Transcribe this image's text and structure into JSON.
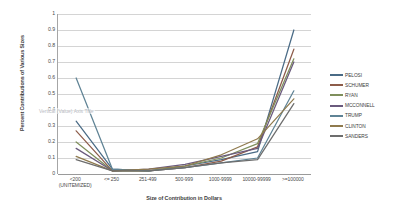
{
  "chart_data": {
    "type": "line",
    "title": "",
    "xlabel": "Size of Contribution in Dollars",
    "ylabel": "Percent Contributions of Various Sizes",
    "ylim": [
      0,
      1
    ],
    "grid": true,
    "legend_position": "right",
    "categories": [
      "<200 (UNITEMIZED)",
      "<= 250",
      "251-499",
      "500-999",
      "1000-9999",
      "10000-99999",
      ">=100000"
    ],
    "ytick_labels": [
      "0",
      "0.1",
      "0.2",
      "0.3",
      "0.4",
      "0.5",
      "0.6",
      "0.7",
      "0.8",
      "0.9",
      "1"
    ],
    "ytick_values": [
      0,
      0.1,
      0.2,
      0.3,
      0.4,
      0.5,
      0.6,
      0.7,
      0.8,
      0.9,
      1
    ],
    "series": [
      {
        "name": "PELOSI",
        "color": "#4a6b86",
        "values": [
          0.33,
          0.03,
          0.02,
          0.05,
          0.09,
          0.14,
          0.9
        ]
      },
      {
        "name": "SCHUMER",
        "color": "#8d5c4a",
        "values": [
          0.27,
          0.02,
          0.02,
          0.04,
          0.08,
          0.17,
          0.78
        ]
      },
      {
        "name": "RYAN",
        "color": "#7f8f5c",
        "values": [
          0.2,
          0.02,
          0.02,
          0.05,
          0.1,
          0.19,
          0.72
        ]
      },
      {
        "name": "MCCONNELL",
        "color": "#6a5a7d",
        "values": [
          0.16,
          0.02,
          0.03,
          0.06,
          0.11,
          0.16,
          0.7
        ]
      },
      {
        "name": "TRUMP",
        "color": "#5f8395",
        "values": [
          0.6,
          0.03,
          0.02,
          0.04,
          0.07,
          0.1,
          0.52
        ]
      },
      {
        "name": "CLINTON",
        "color": "#8f7a4e",
        "values": [
          0.11,
          0.02,
          0.03,
          0.05,
          0.12,
          0.22,
          0.47
        ]
      },
      {
        "name": "SANDERS",
        "color": "#6d6d6d",
        "values": [
          0.09,
          0.02,
          0.02,
          0.04,
          0.07,
          0.09,
          0.44
        ]
      }
    ],
    "annotations": [
      {
        "name": "vertical-axis-title-placeholder",
        "text": "Vertical (Value) Axis Title"
      }
    ]
  }
}
